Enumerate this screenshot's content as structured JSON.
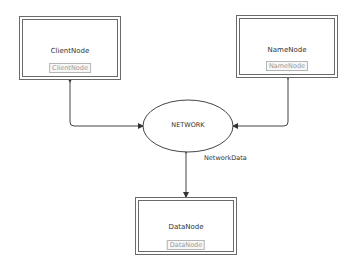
{
  "diagram": {
    "nodes": [
      {
        "id": "client",
        "title": "ClientNode",
        "tag": "ClientNode"
      },
      {
        "id": "name",
        "title": "NameNode",
        "tag": "NameNode"
      },
      {
        "id": "data",
        "title": "DataNode",
        "tag": "DataNode"
      }
    ],
    "hub": {
      "label": "NETWORK"
    },
    "edges": [
      {
        "from": "client",
        "to": "NETWORK",
        "label": ""
      },
      {
        "from": "name",
        "to": "NETWORK",
        "label": ""
      },
      {
        "from": "NETWORK",
        "to": "data",
        "label": "NetworkData"
      }
    ],
    "colors": {
      "line": "#444444",
      "box_border": "#6a6a6a",
      "tag_text": "#9a9a9a"
    }
  }
}
